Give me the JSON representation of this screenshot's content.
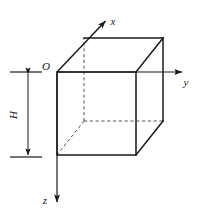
{
  "figure": {
    "background_color": "#ffffff",
    "stroke_color": "#1a1a1a",
    "hidden_edge_color": "#555555",
    "axis_color": "#1a1a1a"
  },
  "labels": {
    "origin": "O",
    "x_axis": "x",
    "y_axis": "y",
    "z_axis": "z",
    "height": "H"
  },
  "geometry": {
    "front_face": {
      "top_left": [
        57,
        72
      ],
      "top_right": [
        136,
        72
      ],
      "bottom_right": [
        136,
        155
      ],
      "bottom_left": [
        57,
        155
      ]
    },
    "back_face": {
      "top_left": [
        84,
        38
      ],
      "top_right": [
        163,
        38
      ],
      "bottom_right": [
        163,
        121
      ],
      "bottom_left": [
        84,
        121
      ]
    },
    "depth_offset": [
      27,
      -34
    ],
    "hidden_vertex": [
      84,
      121
    ]
  },
  "axes": {
    "x": {
      "from": [
        57,
        72
      ],
      "to": [
        108,
        18
      ],
      "label_at": [
        113,
        22
      ]
    },
    "y": {
      "from": [
        57,
        72
      ],
      "to": [
        185,
        72
      ],
      "label_at": [
        185,
        86
      ]
    },
    "z": {
      "from": [
        57,
        72
      ],
      "to": [
        57,
        205
      ],
      "label_at": [
        44,
        203
      ]
    }
  },
  "dimension": {
    "name": "height",
    "value_label": "H",
    "tick_top_y": 72,
    "tick_bottom_y": 157,
    "tick_x_from": 10,
    "tick_x_to": 42,
    "arrow_x": 28,
    "label_at": [
      17,
      115
    ],
    "label_rotation_deg": -90
  }
}
